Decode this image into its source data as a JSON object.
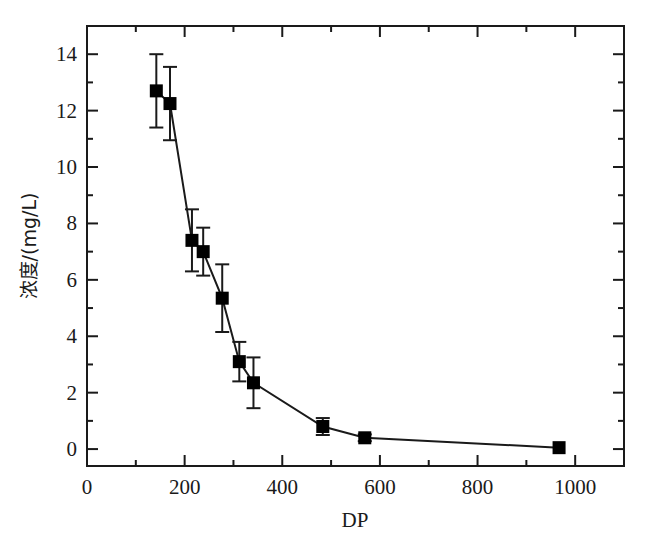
{
  "chart_data": {
    "type": "scatter",
    "title": "",
    "subtitle": "",
    "xlabel": "DP",
    "ylabel": "浓度/(mg/L)",
    "xlim": [
      0,
      1100
    ],
    "ylim": [
      -0.6,
      15.0
    ],
    "grid": false,
    "legend": null,
    "legend_position": "none",
    "marker": "filled-square",
    "marker_color": "#000000",
    "line_color": "#000000",
    "errorbars": true,
    "errorbar_direction": "symmetric-y",
    "x_ticks": [
      0,
      200,
      400,
      600,
      800,
      1000
    ],
    "x_tick_labels": [
      "0",
      "200",
      "400",
      "600",
      "800",
      "1000"
    ],
    "x_minor_ticks": [
      100,
      300,
      500,
      700,
      900,
      1100
    ],
    "y_ticks": [
      0,
      2,
      4,
      6,
      8,
      10,
      12,
      14
    ],
    "y_tick_labels": [
      "0",
      "2",
      "4",
      "6",
      "8",
      "10",
      "12",
      "14"
    ],
    "y_minor_ticks": [
      1,
      3,
      5,
      7,
      9,
      11,
      13
    ],
    "x": [
      142,
      170,
      215,
      238,
      277,
      312,
      341,
      483,
      569,
      967
    ],
    "values": [
      12.7,
      12.25,
      7.4,
      7.0,
      5.35,
      3.1,
      2.35,
      0.8,
      0.4,
      0.05
    ],
    "yerr": [
      1.3,
      1.3,
      1.1,
      0.85,
      1.2,
      0.7,
      0.9,
      0.3,
      0.12,
      0.0
    ],
    "points": [
      {
        "x": 142,
        "y": 12.7,
        "err": 1.3
      },
      {
        "x": 170,
        "y": 12.25,
        "err": 1.3
      },
      {
        "x": 215,
        "y": 7.4,
        "err": 1.1
      },
      {
        "x": 238,
        "y": 7.0,
        "err": 0.85
      },
      {
        "x": 277,
        "y": 5.35,
        "err": 1.2
      },
      {
        "x": 312,
        "y": 3.1,
        "err": 0.7
      },
      {
        "x": 341,
        "y": 2.35,
        "err": 0.9
      },
      {
        "x": 483,
        "y": 0.8,
        "err": 0.3
      },
      {
        "x": 569,
        "y": 0.4,
        "err": 0.12
      },
      {
        "x": 967,
        "y": 0.05,
        "err": 0.0
      }
    ]
  },
  "figure": {
    "background_color": "#ffffff",
    "axis_color": "#1a1a1a",
    "text_color": "#1a1a1a"
  }
}
